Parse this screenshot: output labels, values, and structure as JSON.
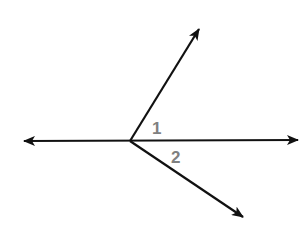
{
  "diagram": {
    "type": "angle-pair",
    "colors": {
      "line": "#111111",
      "label": "#808080",
      "background": "#ffffff"
    },
    "vertex": {
      "x": 130,
      "y": 141
    },
    "line": {
      "left_tip": {
        "x": 24,
        "y": 141
      },
      "right_tip": {
        "x": 298,
        "y": 140
      }
    },
    "rays": [
      {
        "name": "upper-ray",
        "tip": {
          "x": 199,
          "y": 29
        }
      },
      {
        "name": "lower-ray",
        "tip": {
          "x": 243,
          "y": 217
        }
      }
    ],
    "labels": [
      {
        "text": "1",
        "x": 152,
        "y": 134
      },
      {
        "text": "2",
        "x": 171,
        "y": 163
      }
    ]
  }
}
